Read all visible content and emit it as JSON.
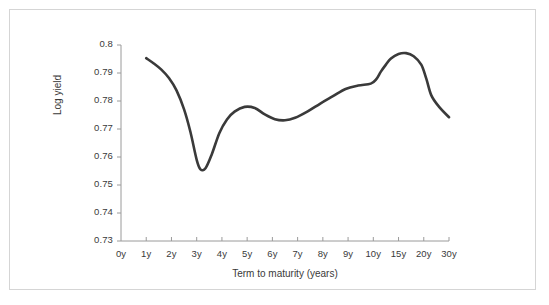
{
  "figure": {
    "background_color": "#ffffff",
    "border_color": "#d5d5d5"
  },
  "axis": {
    "line_color": "#9a9a9a",
    "tick_color": "#9a9a9a",
    "text_color": "#3a3a3a"
  },
  "curve": {
    "color": "#3a3a3a",
    "width_px": 2.6
  },
  "chart_data": {
    "type": "line",
    "title": "",
    "subtitle": "",
    "xlabel": "Term to maturity (years)",
    "ylabel": "Log yield",
    "grid": false,
    "legend": null,
    "legend_position": "none",
    "x_scale": "categorical-equal-spacing",
    "categories": [
      "0y",
      "1y",
      "2y",
      "3y",
      "4y",
      "5y",
      "6y",
      "7y",
      "8y",
      "9y",
      "10y",
      "15y",
      "20y",
      "30y"
    ],
    "xtick_labels": [
      "0y",
      "1y",
      "2y",
      "3y",
      "4y",
      "5y",
      "6y",
      "7y",
      "8y",
      "9y",
      "10y",
      "15y",
      "20y",
      "30y"
    ],
    "ytick_labels": [
      "0.73",
      "0.74",
      "0.75",
      "0.76",
      "0.77",
      "0.78",
      "0.79",
      "0.8"
    ],
    "ytick_values": [
      0.73,
      0.74,
      0.75,
      0.76,
      0.77,
      0.78,
      0.79,
      0.8
    ],
    "ylim": [
      0.73,
      0.8
    ],
    "series": [
      {
        "name": "Log yield curve",
        "x": [
          "1y",
          "2y",
          "3y",
          "4y",
          "5y",
          "6y",
          "7y",
          "8y",
          "9y",
          "10y",
          "15y",
          "20y",
          "30y"
        ],
        "values": [
          0.7953,
          0.787,
          0.7556,
          0.7719,
          0.7779,
          0.7735,
          0.7741,
          0.7794,
          0.7846,
          0.7864,
          0.7965,
          0.7936,
          0.7742
        ]
      }
    ],
    "annotations": [
      {
        "label": "global minimum",
        "x": "3y",
        "y": 0.7556
      },
      {
        "label": "local maximum",
        "x": "5y",
        "y": 0.7779
      },
      {
        "label": "local minimum",
        "x": "6y",
        "y": 0.7731
      },
      {
        "label": "global maximum",
        "x": "17y",
        "y": 0.7971
      },
      {
        "label": "endpoint",
        "x": "30y",
        "y": 0.7742
      }
    ],
    "dense_path_points": [
      {
        "x": 1.0,
        "y": 0.7953
      },
      {
        "x": 1.3,
        "y": 0.7934
      },
      {
        "x": 1.6,
        "y": 0.7912
      },
      {
        "x": 1.9,
        "y": 0.7882
      },
      {
        "x": 2.2,
        "y": 0.7838
      },
      {
        "x": 2.5,
        "y": 0.777
      },
      {
        "x": 2.75,
        "y": 0.769
      },
      {
        "x": 3.0,
        "y": 0.759
      },
      {
        "x": 3.15,
        "y": 0.7556
      },
      {
        "x": 3.35,
        "y": 0.756
      },
      {
        "x": 3.6,
        "y": 0.761
      },
      {
        "x": 3.9,
        "y": 0.7686
      },
      {
        "x": 4.2,
        "y": 0.7734
      },
      {
        "x": 4.5,
        "y": 0.7762
      },
      {
        "x": 4.9,
        "y": 0.7779
      },
      {
        "x": 5.3,
        "y": 0.7775
      },
      {
        "x": 5.7,
        "y": 0.7752
      },
      {
        "x": 6.1,
        "y": 0.7735
      },
      {
        "x": 6.5,
        "y": 0.7731
      },
      {
        "x": 6.9,
        "y": 0.774
      },
      {
        "x": 7.4,
        "y": 0.7763
      },
      {
        "x": 7.9,
        "y": 0.7791
      },
      {
        "x": 8.4,
        "y": 0.7817
      },
      {
        "x": 8.9,
        "y": 0.7843
      },
      {
        "x": 9.4,
        "y": 0.7855
      },
      {
        "x": 9.9,
        "y": 0.7862
      },
      {
        "x": 10.6,
        "y": 0.7878
      },
      {
        "x": 11.5,
        "y": 0.7905
      },
      {
        "x": 12.5,
        "y": 0.793
      },
      {
        "x": 13.5,
        "y": 0.7952
      },
      {
        "x": 15.0,
        "y": 0.7968
      },
      {
        "x": 16.5,
        "y": 0.7971
      },
      {
        "x": 18.0,
        "y": 0.796
      },
      {
        "x": 19.5,
        "y": 0.793
      },
      {
        "x": 21.0,
        "y": 0.788
      },
      {
        "x": 23.0,
        "y": 0.782
      },
      {
        "x": 26.0,
        "y": 0.778
      },
      {
        "x": 30.0,
        "y": 0.7742
      }
    ]
  }
}
